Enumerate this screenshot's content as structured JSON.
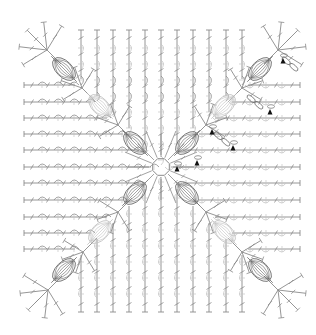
{
  "diagram": {
    "title": "Crochet square motif chart",
    "type": "crochet-symbol-chart",
    "colors": {
      "background": "#ffffff",
      "stitch": "#8a8a8a",
      "stitch_light": "#c4c4c4",
      "stitch_dark": "#6e6e6e",
      "marker": "#111111"
    },
    "bounds": {
      "left": 22,
      "top": 25,
      "right": 300,
      "bottom": 313
    },
    "center": {
      "x": 161,
      "y": 167,
      "ring_radius": 9
    },
    "columns_x": [
      81,
      97,
      113,
      129,
      145,
      161,
      177,
      193,
      209,
      226,
      242
    ],
    "rows_y": [
      85,
      102,
      118,
      134,
      150,
      167,
      183,
      200,
      217,
      233,
      249
    ],
    "diagonal_hubs": [
      {
        "x": 47,
        "y": 50,
        "corner": true
      },
      {
        "x": 82,
        "y": 88
      },
      {
        "x": 118,
        "y": 125
      },
      {
        "x": 206,
        "y": 125
      },
      {
        "x": 242,
        "y": 88
      },
      {
        "x": 278,
        "y": 50,
        "corner": true
      },
      {
        "x": 118,
        "y": 212
      },
      {
        "x": 83,
        "y": 252
      },
      {
        "x": 48,
        "y": 290,
        "corner": true
      },
      {
        "x": 206,
        "y": 212
      },
      {
        "x": 242,
        "y": 252
      },
      {
        "x": 278,
        "y": 290,
        "corner": true
      }
    ],
    "shells": [
      {
        "x": 64,
        "y": 69,
        "angle": 45,
        "tone": "dark"
      },
      {
        "x": 100,
        "y": 106,
        "angle": 45,
        "tone": "light"
      },
      {
        "x": 135,
        "y": 143,
        "angle": 45,
        "tone": "dark"
      },
      {
        "x": 187,
        "y": 143,
        "angle": -45,
        "tone": "dark"
      },
      {
        "x": 224,
        "y": 106,
        "angle": -45,
        "tone": "light"
      },
      {
        "x": 260,
        "y": 69,
        "angle": -45,
        "tone": "dark"
      },
      {
        "x": 135,
        "y": 193,
        "angle": -45,
        "tone": "dark"
      },
      {
        "x": 100,
        "y": 232,
        "angle": -45,
        "tone": "light"
      },
      {
        "x": 64,
        "y": 270,
        "angle": -45,
        "tone": "dark"
      },
      {
        "x": 187,
        "y": 193,
        "angle": 45,
        "tone": "dark"
      },
      {
        "x": 224,
        "y": 232,
        "angle": 45,
        "tone": "light"
      },
      {
        "x": 260,
        "y": 270,
        "angle": 45,
        "tone": "dark"
      }
    ],
    "markers": [
      {
        "x": 177,
        "y": 170,
        "label": "start-marker"
      },
      {
        "x": 197,
        "y": 164,
        "label": "round-marker"
      },
      {
        "x": 212,
        "y": 133,
        "label": "round-marker"
      },
      {
        "x": 233,
        "y": 149,
        "label": "round-marker"
      },
      {
        "x": 270,
        "y": 113,
        "label": "round-marker"
      },
      {
        "x": 283,
        "y": 62,
        "label": "round-marker"
      }
    ],
    "chain_loops": [
      {
        "x": 222,
        "y": 139,
        "angle": 40
      },
      {
        "x": 255,
        "y": 102,
        "angle": 40
      },
      {
        "x": 290,
        "y": 64,
        "angle": 40
      }
    ]
  }
}
